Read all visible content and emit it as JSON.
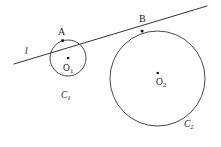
{
  "figure": {
    "background_color": "#ffffff",
    "stroke_color": "#333333",
    "text_color": "#1a1a1a",
    "width": 221,
    "height": 147
  },
  "labels": {
    "line_label": "l",
    "tangent_point_small": "A",
    "tangent_point_large": "B",
    "center_small": "O",
    "center_small_sub": "1",
    "center_large": "O",
    "center_large_sub": "2",
    "circle_small": "C",
    "circle_small_sub": "1",
    "circle_large": "C",
    "circle_large_sub": "2"
  },
  "geometry": {
    "line": {
      "name": "tangent-line-l",
      "x1": 14,
      "y1": 64,
      "x2": 207,
      "y2": 6
    },
    "circle_small": {
      "name": "circle-c1",
      "cx": 68,
      "cy": 58,
      "r": 18
    },
    "circle_large": {
      "name": "circle-c2",
      "cx": 157.5,
      "cy": 78.5,
      "r": 47.5
    },
    "points": [
      {
        "name": "point-a",
        "label": "A",
        "x": 62.5,
        "y": 40.5,
        "r": 1.6
      },
      {
        "name": "point-b",
        "label": "B",
        "x": 142,
        "y": 31,
        "r": 1.6
      },
      {
        "name": "point-o1",
        "label": "O1",
        "x": 68,
        "y": 58,
        "r": 1.3
      },
      {
        "name": "point-o2",
        "label": "O2",
        "x": 157.5,
        "y": 73,
        "r": 1.3
      }
    ]
  }
}
